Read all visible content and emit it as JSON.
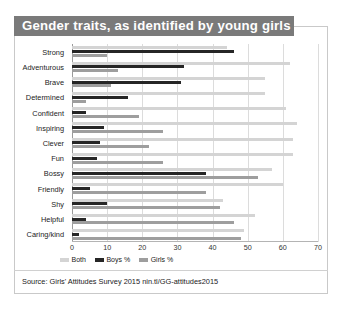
{
  "title": "Gender traits, as identified by young girls",
  "source": "Source: Girls' Attitudes Survey 2015 nin.tl/GG-attitudes2015",
  "legend": [
    {
      "label": "Both",
      "color": "#d4d4d4",
      "key": "both"
    },
    {
      "label": "Boys %",
      "color": "#262626",
      "key": "boys"
    },
    {
      "label": "Girls %",
      "color": "#9e9e9e",
      "key": "girls"
    }
  ],
  "colors": {
    "both": "#d4d4d4",
    "boys": "#262626",
    "girls": "#9e9e9e",
    "title_banner": "#7a7a7a",
    "grid": "#dcdcdc",
    "frame": "#c9c9c9"
  },
  "chart_data": {
    "type": "bar",
    "orientation": "horizontal",
    "title": "Gender traits, as identified by young girls",
    "xlabel": "",
    "ylabel": "",
    "xlim": [
      0,
      70
    ],
    "xticks": [
      0,
      10,
      20,
      30,
      40,
      50,
      60,
      70
    ],
    "grid": true,
    "legend_position": "bottom-left",
    "categories": [
      "Strong",
      "Adventurous",
      "Brave",
      "Determined",
      "Confident",
      "Inspiring",
      "Clever",
      "Fun",
      "Bossy",
      "Friendly",
      "Shy",
      "Helpful",
      "Caring/kind"
    ],
    "series": [
      {
        "name": "Both",
        "color": "#d4d4d4",
        "values": [
          44,
          62,
          55,
          55,
          61,
          64,
          63,
          63,
          57,
          60,
          43,
          52,
          49
        ]
      },
      {
        "name": "Boys %",
        "color": "#262626",
        "values": [
          46,
          32,
          31,
          16,
          4,
          9,
          8,
          7,
          38,
          5,
          10,
          4,
          2
        ]
      },
      {
        "name": "Girls %",
        "color": "#9e9e9e",
        "values": [
          10,
          13,
          11,
          4,
          19,
          26,
          22,
          26,
          53,
          38,
          42,
          46,
          48
        ]
      }
    ]
  },
  "source_text": "Source: Girls' Attitudes Survey 2015 nin.tl/GG-attitudes2015"
}
